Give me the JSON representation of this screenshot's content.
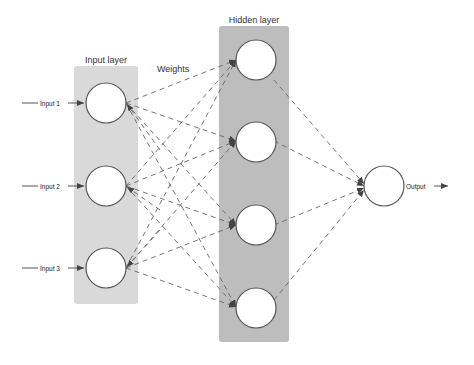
{
  "diagram": {
    "labels": {
      "input_layer": "Input layer",
      "hidden_layer": "Hidden layer",
      "weights": "Weights",
      "output": "Output"
    },
    "inputs": [
      {
        "label": "Input 1"
      },
      {
        "label": "Input 2"
      },
      {
        "label": "Input 3"
      }
    ],
    "hidden_nodes": 4,
    "output_nodes": 1,
    "colors": {
      "input_box": "#d9d9d9",
      "hidden_box": "#bfbfbf",
      "node_fill": "#ffffff",
      "node_stroke": "#555555",
      "edge": "#666666"
    }
  }
}
